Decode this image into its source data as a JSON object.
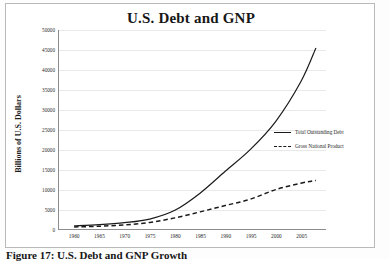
{
  "figure": {
    "caption": "Figure 17: U.S. Debt and GNP Growth"
  },
  "chart_data": {
    "type": "line",
    "title": "U.S. Debt and GNP",
    "xlabel": "",
    "ylabel": "Billions of U.S. Dollars",
    "xlim": [
      1957,
      2010
    ],
    "ylim": [
      0,
      50000
    ],
    "grid": true,
    "legend_position": "right",
    "xticks": [
      "1960",
      "1965",
      "1970",
      "1975",
      "1980",
      "1985",
      "1990",
      "1995",
      "2000",
      "2005"
    ],
    "xtick_values": [
      1960,
      1965,
      1970,
      1975,
      1980,
      1985,
      1990,
      1995,
      2000,
      2005
    ],
    "yticks": [
      "0",
      "5000",
      "10000",
      "15000",
      "20000",
      "25000",
      "30000",
      "35000",
      "40000",
      "45000",
      "50000"
    ],
    "ytick_values": [
      0,
      5000,
      10000,
      15000,
      20000,
      25000,
      30000,
      35000,
      40000,
      45000,
      50000
    ],
    "x": [
      1960,
      1965,
      1970,
      1975,
      1980,
      1985,
      1990,
      1995,
      2000,
      2005,
      2008
    ],
    "series": [
      {
        "name": "Total Outstanding Debt",
        "style": "solid",
        "color": "#1a1a1a",
        "values": [
          800,
          1100,
          1600,
          2500,
          4700,
          9000,
          14500,
          20000,
          27000,
          37000,
          45500
        ]
      },
      {
        "name": "Gross National Product",
        "style": "dashed",
        "color": "#1a1a1a",
        "values": [
          520,
          700,
          1030,
          1650,
          2800,
          4300,
          5900,
          7500,
          9900,
          11500,
          12200
        ]
      }
    ]
  }
}
